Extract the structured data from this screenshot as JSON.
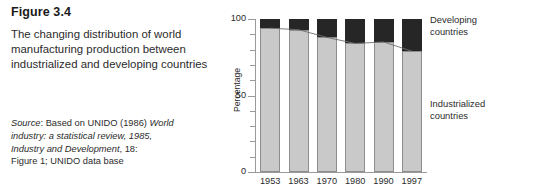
{
  "caption": {
    "figure_number": "Figure 3.4",
    "description": "The changing distribution of world manufacturing production between industrialized and developing countries",
    "source_prefix": "Source",
    "source_line1a": ": Based on UNIDO (1986) ",
    "source_italic1": "World",
    "source_italic2": "industry: a statistical review, 1985,",
    "source_italic3": "Industry and Development",
    "source_line3b": ", 18:",
    "source_line4": "Figure 1; UNIDO data base"
  },
  "chart_data": {
    "type": "bar",
    "title": "The changing distribution of world manufacturing production between industrialized and developing countries",
    "xlabel": "",
    "ylabel": "Percentage",
    "ylim": [
      0,
      100
    ],
    "yticks_major": [
      0,
      50,
      100
    ],
    "yticks_minor": [
      10,
      20,
      30,
      40,
      60,
      70,
      80,
      90
    ],
    "ytick_labels": [
      "0",
      "50",
      "100"
    ],
    "grid": false,
    "stacked": true,
    "legend_position": "right",
    "categories": [
      "1953",
      "1963",
      "1970",
      "1980",
      "1990",
      "1997"
    ],
    "series": [
      {
        "name": "Industrialized countries",
        "color": "#c9c9c9",
        "values": [
          94,
          93,
          88,
          84,
          85,
          79
        ]
      },
      {
        "name": "Developing countries",
        "color": "#262626",
        "values": [
          6,
          7,
          12,
          16,
          15,
          21
        ]
      }
    ],
    "trend_line": {
      "name": "Industrialized share trend",
      "color": "#6e6e6e",
      "values": [
        94,
        93,
        88,
        84,
        85,
        79
      ]
    }
  },
  "legend": {
    "developing_line1": "Developing",
    "developing_line2": "countries",
    "industrialized_line1": "Industrialized",
    "industrialized_line2": "countries"
  }
}
